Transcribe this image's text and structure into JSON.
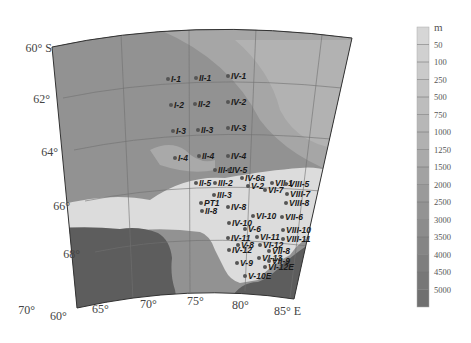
{
  "map": {
    "lat_labels": [
      {
        "text": "60° S",
        "x": 52,
        "y": 52
      },
      {
        "text": "62°",
        "x": 50,
        "y": 103
      },
      {
        "text": "64°",
        "x": 58,
        "y": 156
      },
      {
        "text": "66°",
        "x": 70,
        "y": 210
      },
      {
        "text": "68°",
        "x": 80,
        "y": 258
      },
      {
        "text": "70°",
        "x": 35,
        "y": 314
      }
    ],
    "lon_labels": [
      {
        "text": "60°",
        "x": 50,
        "y": 320
      },
      {
        "text": "65°",
        "x": 92,
        "y": 313
      },
      {
        "text": "70°",
        "x": 140,
        "y": 308
      },
      {
        "text": "75°",
        "x": 187,
        "y": 305
      },
      {
        "text": "80°",
        "x": 232,
        "y": 309
      },
      {
        "text": "85° E",
        "x": 274,
        "y": 315
      }
    ],
    "stations": [
      {
        "id": "I-1",
        "x": 171,
        "y": 82
      },
      {
        "id": "II-1",
        "x": 199,
        "y": 81
      },
      {
        "id": "IV-1",
        "x": 231,
        "y": 79
      },
      {
        "id": "I-2",
        "x": 174,
        "y": 108
      },
      {
        "id": "II-2",
        "x": 198,
        "y": 107
      },
      {
        "id": "IV-2",
        "x": 231,
        "y": 105
      },
      {
        "id": "I-3",
        "x": 176,
        "y": 134
      },
      {
        "id": "II-3",
        "x": 201,
        "y": 133
      },
      {
        "id": "IV-3",
        "x": 231,
        "y": 131
      },
      {
        "id": "I-4",
        "x": 178,
        "y": 161
      },
      {
        "id": "II-4",
        "x": 202,
        "y": 159
      },
      {
        "id": "IV-4",
        "x": 231,
        "y": 159
      },
      {
        "id": "III-1",
        "x": 218,
        "y": 173
      },
      {
        "id": "IV-5",
        "x": 232,
        "y": 173
      },
      {
        "id": "IV-6a",
        "x": 245,
        "y": 181
      },
      {
        "id": "VII-1",
        "x": 275,
        "y": 186
      },
      {
        "id": "II-5",
        "x": 199,
        "y": 186
      },
      {
        "id": "III-2",
        "x": 218,
        "y": 186
      },
      {
        "id": "V-2",
        "x": 251,
        "y": 189
      },
      {
        "id": "VI-7",
        "x": 268,
        "y": 193
      },
      {
        "id": "VIII-5",
        "x": 289,
        "y": 187
      },
      {
        "id": "VIII-7",
        "x": 290,
        "y": 197
      },
      {
        "id": "III-3",
        "x": 217,
        "y": 198
      },
      {
        "id": "VIII-8",
        "x": 289,
        "y": 206
      },
      {
        "id": "PT1",
        "x": 204,
        "y": 206
      },
      {
        "id": "IV-8",
        "x": 231,
        "y": 210
      },
      {
        "id": "II-8",
        "x": 205,
        "y": 214
      },
      {
        "id": "VI-10",
        "x": 256,
        "y": 219
      },
      {
        "id": "VII-6",
        "x": 285,
        "y": 220
      },
      {
        "id": "IV-10",
        "x": 232,
        "y": 226
      },
      {
        "id": "V-6",
        "x": 248,
        "y": 232
      },
      {
        "id": "VIII-10",
        "x": 286,
        "y": 233
      },
      {
        "id": "IV-11",
        "x": 231,
        "y": 241
      },
      {
        "id": "VI-11",
        "x": 260,
        "y": 240
      },
      {
        "id": "VIII-11",
        "x": 286,
        "y": 242
      },
      {
        "id": "V-8",
        "x": 241,
        "y": 248
      },
      {
        "id": "VI-12",
        "x": 263,
        "y": 248
      },
      {
        "id": "IV-12",
        "x": 232,
        "y": 253
      },
      {
        "id": "VII-8",
        "x": 272,
        "y": 254
      },
      {
        "id": "VI-13",
        "x": 262,
        "y": 261
      },
      {
        "id": "V-9",
        "x": 240,
        "y": 266
      },
      {
        "id": "VII-9",
        "x": 272,
        "y": 264
      },
      {
        "id": "VI-12E",
        "x": 268,
        "y": 270
      },
      {
        "id": "V-10E",
        "x": 248,
        "y": 279
      }
    ],
    "colors": {
      "deep_ocean": "#8d8d8d",
      "mid_ocean": "#9f9f9f",
      "shelf": "#d8d8d8",
      "land": "#5f5f5f",
      "grid": "#6e6e6e",
      "outline": "#333333"
    }
  },
  "legend": {
    "unit": "m",
    "ticks": [
      "50",
      "100",
      "250",
      "500",
      "750",
      "1000",
      "1250",
      "1500",
      "2000",
      "2500",
      "3000",
      "3500",
      "4000",
      "4500",
      "5000"
    ],
    "colors": [
      "#d6d6d6",
      "#d0d0d0",
      "#cacaca",
      "#c3c3c3",
      "#bdbdbd",
      "#b7b7b7",
      "#b1b1b1",
      "#aaaaaa",
      "#a2a2a2",
      "#9a9a9a",
      "#939393",
      "#8c8c8c",
      "#858585",
      "#7e7e7e",
      "#777777",
      "#707070"
    ]
  }
}
